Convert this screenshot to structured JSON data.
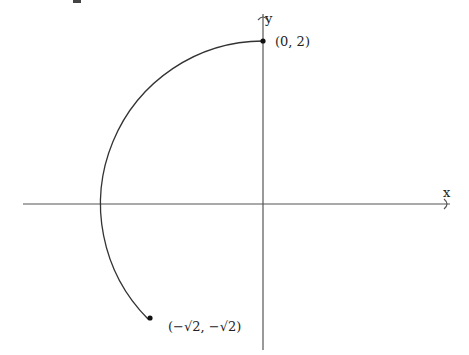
{
  "diagram": {
    "type": "parametric-arc",
    "axes": {
      "x_label": "x",
      "y_label": "y"
    },
    "arc": {
      "center": [
        0,
        0
      ],
      "radius": 2,
      "from_point": "(0,2)",
      "to_point": "(-√2,-√2)",
      "direction": "counterclockwise"
    },
    "points": [
      {
        "label": "(0, 2)",
        "x": 0,
        "y": 2
      },
      {
        "label": "(−√2, −√2)",
        "x": -1.414,
        "y": -1.414
      }
    ],
    "colors": {
      "stroke": "#333333",
      "axis": "#555555",
      "text": "#222222"
    }
  }
}
